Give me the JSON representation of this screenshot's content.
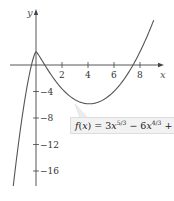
{
  "chart_data": {
    "type": "line",
    "title": "",
    "xlabel": "x",
    "ylabel": "y",
    "xlim": [
      -2.8,
      9.6
    ],
    "ylim": [
      -19.5,
      9.8
    ],
    "x_ticks": [
      2,
      4,
      6,
      8
    ],
    "x_tick_labels": [
      "2",
      "4",
      "6",
      "8"
    ],
    "y_ticks": [
      -4,
      -8,
      -12,
      -16
    ],
    "y_tick_labels": [
      "−4",
      "−8",
      "−12",
      "−16"
    ],
    "grid": false,
    "legend": null,
    "annotation": {
      "text": "f(x) = 3x^(5/3) − 6x^(4/3) + 2",
      "points_to": [
        3.0,
        -5.3
      ]
    },
    "series": [
      {
        "name": "f(x) = 3x^(5/3) - 6x^(4/3) + 2",
        "x": [
          -2.0,
          -1.0,
          -0.5,
          0,
          0.5,
          1,
          2,
          3,
          4,
          4.1,
          5,
          6,
          7,
          8,
          9
        ],
        "y": [
          -21.8,
          -7.0,
          -1.7,
          2.0,
          0.71,
          -1.0,
          -4.0,
          -5.5,
          -5.86,
          -5.86,
          -5.1,
          -3.2,
          -0.3,
          2.0,
          8.4
        ]
      }
    ]
  },
  "labels": {
    "x_axis": "x",
    "y_axis": "y",
    "x_ticks": [
      "2",
      "4",
      "6",
      "8"
    ],
    "y_ticks": [
      "−4",
      "−8",
      "−12",
      "−16"
    ],
    "function_prefix": "f(x) = 3x",
    "exp1": "5/3",
    "mid": " − 6x",
    "exp2": "4/3",
    "suffix": " + 2"
  }
}
